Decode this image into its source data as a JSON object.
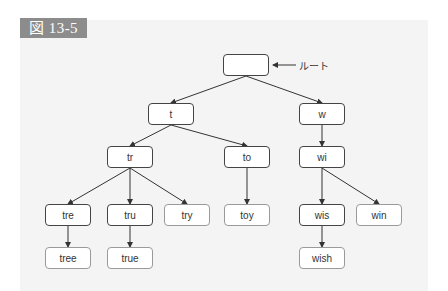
{
  "figure": {
    "label": "図 13-5",
    "root_annotation": "ルート"
  },
  "nodes": [
    {
      "id": "root",
      "text": "",
      "type": "internal",
      "x": 223,
      "y": 54
    },
    {
      "id": "t",
      "text": "t",
      "type": "internal",
      "x": 148,
      "y": 103
    },
    {
      "id": "w",
      "text": "w",
      "type": "internal",
      "x": 299,
      "y": 103
    },
    {
      "id": "tr",
      "text": "tr",
      "type": "internal",
      "x": 107,
      "y": 146
    },
    {
      "id": "to",
      "text": "to",
      "type": "internal",
      "x": 224,
      "y": 146
    },
    {
      "id": "wi",
      "text": "wi",
      "type": "internal",
      "x": 299,
      "y": 146
    },
    {
      "id": "tre",
      "text": "tre",
      "type": "internal",
      "x": 45,
      "y": 204
    },
    {
      "id": "tru",
      "text": "tru",
      "type": "internal",
      "x": 107,
      "y": 204
    },
    {
      "id": "try",
      "text": "try",
      "type": "leaf",
      "x": 164,
      "y": 204
    },
    {
      "id": "toy",
      "text": "toy",
      "type": "leaf",
      "x": 224,
      "y": 204
    },
    {
      "id": "wis",
      "text": "wis",
      "type": "internal",
      "x": 299,
      "y": 204
    },
    {
      "id": "win",
      "text": "win",
      "type": "leaf",
      "x": 356,
      "y": 204
    },
    {
      "id": "tree",
      "text": "tree",
      "type": "leaf",
      "x": 45,
      "y": 247
    },
    {
      "id": "true",
      "text": "true",
      "type": "leaf",
      "x": 107,
      "y": 247
    },
    {
      "id": "wish",
      "text": "wish",
      "type": "leaf",
      "x": 299,
      "y": 247
    }
  ],
  "edges": [
    [
      "root",
      "t"
    ],
    [
      "root",
      "w"
    ],
    [
      "t",
      "tr"
    ],
    [
      "t",
      "to"
    ],
    [
      "w",
      "wi"
    ],
    [
      "tr",
      "tre"
    ],
    [
      "tr",
      "tru"
    ],
    [
      "tr",
      "try"
    ],
    [
      "to",
      "toy"
    ],
    [
      "wi",
      "wis"
    ],
    [
      "wi",
      "win"
    ],
    [
      "tre",
      "tree"
    ],
    [
      "tru",
      "true"
    ],
    [
      "wis",
      "wish"
    ]
  ],
  "colors": {
    "label_bg": "#8c8c8c",
    "panel_bg": "#f4f4f4",
    "internal_border": "#444444",
    "leaf_border": "#9a9a9a",
    "edge": "#333333"
  }
}
